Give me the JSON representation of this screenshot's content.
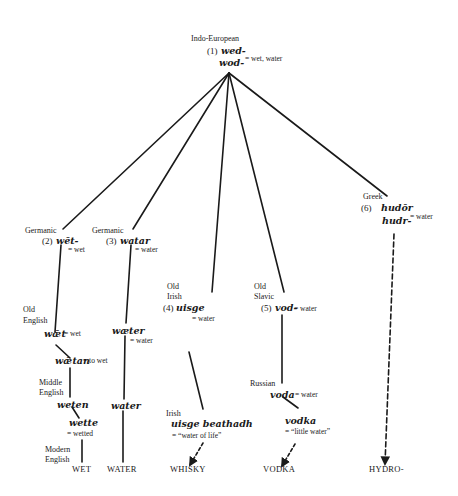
{
  "root": {
    "language": "Indo-European",
    "number": "(1)",
    "forms": [
      "wed-",
      "wod-"
    ],
    "gloss": "= wet, water"
  },
  "branches": {
    "germanic_wet": {
      "language": "Germanic",
      "number": "(2)",
      "form": "wēt-",
      "gloss": "= wet",
      "old_english": {
        "language_line1": "Old",
        "language_line2": "English",
        "form": "wǣt",
        "gloss": "= wet"
      },
      "old_english_verb": {
        "form": "wǣtan",
        "gloss": "= to wet"
      },
      "middle_english": {
        "language_line1": "Middle",
        "language_line2": "English",
        "form": "weten"
      },
      "middle_english_pp": {
        "form": "wette",
        "gloss": "= wetted"
      },
      "modern_english": {
        "language_line1": "Modern",
        "language_line2": "English",
        "result": "WET"
      }
    },
    "germanic_water": {
      "language": "Germanic",
      "number": "(3)",
      "form": "watar",
      "gloss": "= water",
      "old_english": {
        "form": "wæter",
        "gloss": "= water"
      },
      "middle_english": {
        "form": "water"
      },
      "result": "WATER"
    },
    "irish": {
      "language_line1": "Old",
      "language_line2": "Irish",
      "number": "(4)",
      "form": "uisge",
      "gloss": "= water",
      "later": {
        "language": "Irish",
        "form": "uisge beathadh",
        "gloss": "= “water of life”"
      },
      "result": "WHISKY"
    },
    "slavic": {
      "language_line1": "Old",
      "language_line2": "Slavic",
      "number": "(5)",
      "form": "vod-",
      "gloss": "= water",
      "russian": {
        "language": "Russian",
        "form": "voda",
        "gloss": "= water"
      },
      "diminutive": {
        "form": "vodka",
        "gloss": "= “little water”"
      },
      "result": "VODKA"
    },
    "greek": {
      "language": "Greek",
      "number": "(6)",
      "forms": [
        "hudōr",
        "hudr-"
      ],
      "gloss": "= water",
      "result": "HYDRO-"
    }
  }
}
